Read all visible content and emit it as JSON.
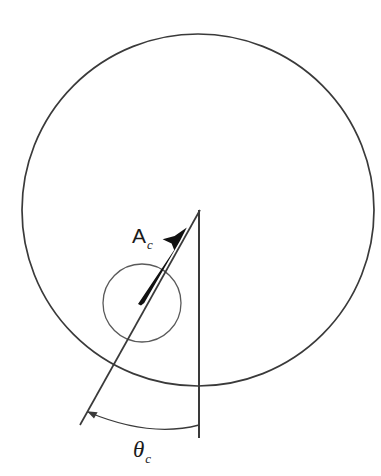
{
  "figure": {
    "name": "cavity-vector-angle-diagram",
    "background_color": "#ffffff",
    "width": 381,
    "height": 476
  },
  "colors": {
    "outer_circle_stroke": "#3a3a3a",
    "inner_circle_stroke": "#5a5a5a",
    "vertical_line_stroke": "#3a3a3a",
    "radial_line_stroke": "#3a3a3a",
    "arrow_fill": "#111111",
    "arc_stroke": "#3a3a3a",
    "label_color": "#1a1a1a"
  },
  "labels": {
    "vector": {
      "symbol": "A",
      "subscript": "c",
      "x": 132,
      "y": 243
    },
    "angle": {
      "symbol": "θ",
      "subscript": "c",
      "x": 133,
      "y": 457
    }
  },
  "geometry": {
    "outer_circle": {
      "cx": 198,
      "cy": 210,
      "r": 176,
      "stroke_width": 1.7
    },
    "inner_circle": {
      "cx": 142,
      "cy": 303,
      "r": 39,
      "stroke_width": 1.3
    },
    "vertical_line": {
      "x": 199,
      "y1": 210,
      "y2": 438,
      "stroke_width": 2
    },
    "radial_line": {
      "x1": 200,
      "y1": 210,
      "x2": 80,
      "y2": 425,
      "stroke_width": 1.7
    },
    "vector_arrow": {
      "tail_x": 141,
      "tail_y": 305,
      "tip_x": 186,
      "tip_y": 228,
      "shaft_max_width": 6.5
    },
    "angle_arc": {
      "start_x": 88,
      "start_y": 412,
      "end_x": 199,
      "end_y": 425,
      "sweep_control_x": 150,
      "sweep_control_y": 438,
      "stroke_width": 1.3,
      "arrowhead_at": "start"
    }
  }
}
